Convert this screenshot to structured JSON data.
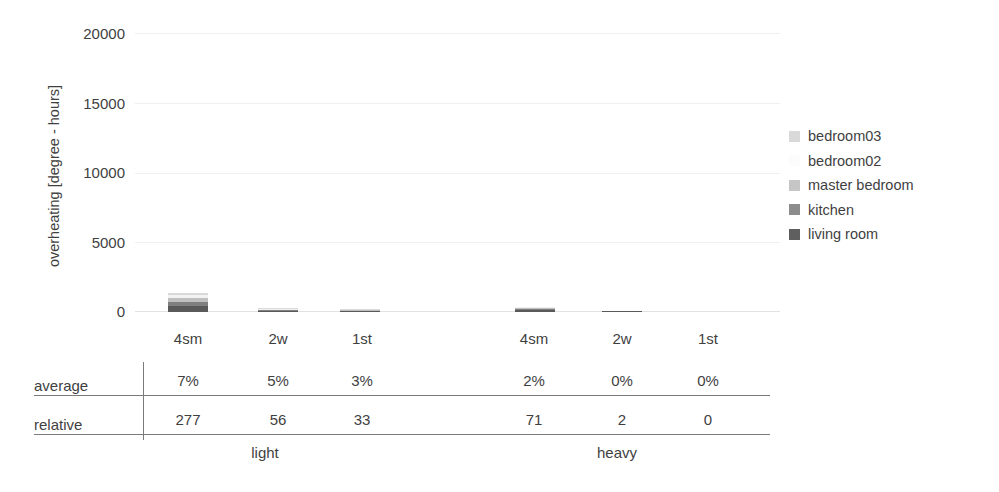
{
  "chart_data": {
    "type": "bar",
    "subtype": "stacked-bar",
    "title": "",
    "xlabel": "",
    "ylabel": "overheating [degree - hours]",
    "ylim": [
      0,
      20000
    ],
    "yticks": [
      0,
      5000,
      10000,
      15000,
      20000
    ],
    "ytick_labels": [
      "0",
      "5000",
      "10000",
      "15000",
      "20000"
    ],
    "grid": true,
    "legend_position": "right",
    "categories": [
      "4sm",
      "2w",
      "1st",
      "4sm",
      "2w",
      "1st"
    ],
    "groups": [
      {
        "label": "light",
        "categories": [
          "4sm",
          "2w",
          "1st"
        ]
      },
      {
        "label": "heavy",
        "categories": [
          "4sm",
          "2w",
          "1st"
        ]
      }
    ],
    "series": [
      {
        "name": "living room",
        "color": "#595959",
        "values": [
          430,
          70,
          40,
          110,
          2,
          0
        ]
      },
      {
        "name": "kitchen",
        "color": "#7f7f7f",
        "values": [
          280,
          60,
          35,
          95,
          1,
          0
        ]
      },
      {
        "name": "master bedroom",
        "color": "#bfbfbf",
        "values": [
          330,
          40,
          25,
          80,
          0,
          0
        ]
      },
      {
        "name": "bedroom02",
        "color": "#f2f2f2",
        "values": [
          200,
          20,
          15,
          40,
          0,
          0
        ]
      },
      {
        "name": "bedroom03",
        "color": "#d9d9d9",
        "values": [
          160,
          10,
          5,
          25,
          0,
          0
        ]
      }
    ],
    "totals": [
      1400,
      200,
      120,
      350,
      3,
      0
    ]
  },
  "axis": {
    "y_title": "overheating [degree - hours]",
    "y_ticks": [
      {
        "label": "20000",
        "value": 20000
      },
      {
        "label": "15000",
        "value": 15000
      },
      {
        "label": "10000",
        "value": 10000
      },
      {
        "label": "5000",
        "value": 5000
      },
      {
        "label": "0",
        "value": 0
      }
    ],
    "x_labels": [
      "4sm",
      "2w",
      "1st",
      "4sm",
      "2w",
      "1st"
    ]
  },
  "legend": {
    "items": [
      {
        "label": "bedroom03",
        "color": "#d9d9d9"
      },
      {
        "label": "bedroom02",
        "color": "#fcfcfc"
      },
      {
        "label": "master bedroom",
        "color": "#c6c6c6"
      },
      {
        "label": "kitchen",
        "color": "#8c8c8c"
      },
      {
        "label": "living room",
        "color": "#5f5f5f"
      }
    ]
  },
  "table": {
    "rows": [
      {
        "label": "average",
        "values": [
          "7%",
          "5%",
          "3%",
          "2%",
          "0%",
          "0%"
        ]
      },
      {
        "label": "relative",
        "values": [
          "277",
          "56",
          "33",
          "71",
          "2",
          "0"
        ]
      }
    ],
    "group_labels": [
      "light",
      "heavy"
    ]
  },
  "colors": {
    "text": "#3f3f3f",
    "rule": "#7b7b7b",
    "gridline": "#f0f0f0",
    "background": "#ffffff"
  }
}
